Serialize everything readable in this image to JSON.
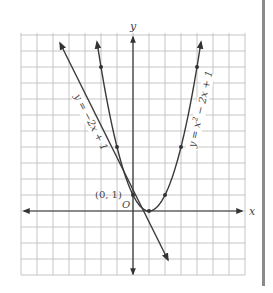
{
  "chart_data": {
    "type": "line",
    "title": "",
    "xlabel": "x",
    "ylabel": "y",
    "xlim": [
      -7,
      7
    ],
    "ylim": [
      -4,
      11.2
    ],
    "grid": true,
    "series": [
      {
        "name": "y = -2x + 1",
        "type": "line",
        "points": [
          [
            -3,
            7
          ],
          [
            2.4,
            -3.8
          ]
        ],
        "marked_points": [
          [
            0,
            1
          ]
        ]
      },
      {
        "name": "y = x² - 2x + 1",
        "type": "parabola",
        "vertex": [
          1,
          0
        ],
        "marked_points": [
          [
            -2,
            9
          ],
          [
            -1,
            4
          ],
          [
            0,
            1
          ],
          [
            1,
            0
          ],
          [
            2,
            1
          ],
          [
            3,
            4
          ],
          [
            4,
            9
          ]
        ]
      }
    ],
    "annotations": [
      {
        "text": "(0, 1)",
        "at": [
          0,
          1
        ]
      },
      {
        "text": "O",
        "at": [
          0,
          0
        ]
      }
    ]
  },
  "labels": {
    "x_axis": "x",
    "y_axis": "y",
    "origin": "O",
    "point": "(0, 1)",
    "line_eq_a": "y = −2x + 1",
    "parabola_eq": "y = x",
    "parabola_eq_rest": " − 2x + 1",
    "parabola_exp": "2"
  },
  "colors": {
    "grid": "#b8b8b8",
    "axis": "#333333",
    "curve": "#3a3a3a",
    "sidebar": "#8a8a8a"
  }
}
